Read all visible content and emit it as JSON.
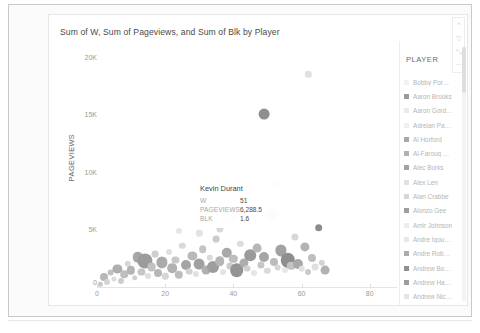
{
  "visual": {
    "title": "Sum of W, Sum of Pageviews, and Sum of Blk by Player"
  },
  "controls": {
    "expand_icon": "⌃",
    "filter_icon": "▽",
    "focus_icon": "⤡",
    "more_icon": "⋯"
  },
  "tooltip": {
    "title": "Kevin Durant",
    "rows": [
      {
        "key": "W",
        "value": "51"
      },
      {
        "key": "PAGEVIEWS",
        "value": "6,288.5"
      },
      {
        "key": "BLK",
        "value": "1.6"
      }
    ]
  },
  "legend": {
    "title": "PLAYER",
    "items": [
      {
        "label": "Bobby Por…",
        "color": "#f2f2f2"
      },
      {
        "label": "Aaron Brooks",
        "color": "#9a9a9a"
      },
      {
        "label": "Aaron Gord…",
        "color": "#eaeaea"
      },
      {
        "label": "Adreian Pa…",
        "color": "#f0f0f0"
      },
      {
        "label": "Al Horford",
        "color": "#a8a8a8"
      },
      {
        "label": "Al-Farouq …",
        "color": "#b0b0b0"
      },
      {
        "label": "Alec Burks",
        "color": "#a2a2a2"
      },
      {
        "label": "Alex Len",
        "color": "#e2e2e2"
      },
      {
        "label": "Alan Crabbe",
        "color": "#d6d6d6"
      },
      {
        "label": "Alonzo Gee",
        "color": "#9e9e9e"
      },
      {
        "label": "Amir Johnson",
        "color": "#ededed"
      },
      {
        "label": "Andre Igou…",
        "color": "#e8e8e8"
      },
      {
        "label": "Andre Rob…",
        "color": "#acacac"
      },
      {
        "label": "Andrew Bo…",
        "color": "#8f8f8f"
      },
      {
        "label": "Andrew Ha…",
        "color": "#9c9c9c"
      },
      {
        "label": "Andrew Nic…",
        "color": "#e4e4e4"
      },
      {
        "label": "Andrew Wi…",
        "color": "#dadada"
      },
      {
        "label": "Anthony Be…",
        "color": "#8a8a8a"
      }
    ]
  },
  "chart_data": {
    "type": "scatter",
    "title": "Sum of W, Sum of Pageviews, and Sum of Blk by Player",
    "xlabel": "W",
    "ylabel": "PAGEVIEWS",
    "size_field": "BLK",
    "legend_field": "PLAYER",
    "legend_position": "right",
    "grid": false,
    "xlim": [
      0,
      88
    ],
    "ylim": [
      0,
      21500
    ],
    "xticks": [
      0,
      20,
      40,
      60,
      80
    ],
    "xticklabels": [
      "0",
      "20",
      "40",
      "60",
      "80"
    ],
    "yticks": [
      0,
      5000,
      10000,
      15000,
      20000
    ],
    "yticklabels": [
      "0",
      "5K",
      "10K",
      "15K",
      "20K"
    ],
    "highlighted_point": {
      "label": "Kevin Durant",
      "x": 51,
      "y": 6288.5,
      "size": 1.6
    },
    "points": [
      {
        "x": 1,
        "y": 250,
        "r": 2.2,
        "c": "#c9c9c9"
      },
      {
        "x": 2,
        "y": 900,
        "r": 4.0,
        "c": "#b8b8b8"
      },
      {
        "x": 3,
        "y": 420,
        "r": 3.0,
        "c": "#d4d4d4"
      },
      {
        "x": 4,
        "y": 1250,
        "r": 3.4,
        "c": "#c0c0c0"
      },
      {
        "x": 5,
        "y": 700,
        "r": 2.6,
        "c": "#dcdcdc"
      },
      {
        "x": 6,
        "y": 1600,
        "r": 4.6,
        "c": "#aeaeae"
      },
      {
        "x": 7,
        "y": 500,
        "r": 3.0,
        "c": "#cdcdcd"
      },
      {
        "x": 8,
        "y": 1100,
        "r": 3.8,
        "c": "#bfbfbf"
      },
      {
        "x": 9,
        "y": 2050,
        "r": 3.2,
        "c": "#d8d8d8"
      },
      {
        "x": 10,
        "y": 1450,
        "r": 4.2,
        "c": "#b4b4b4"
      },
      {
        "x": 11,
        "y": 800,
        "r": 2.8,
        "c": "#d0d0d0"
      },
      {
        "x": 12,
        "y": 2600,
        "r": 5.2,
        "c": "#a6a6a6"
      },
      {
        "x": 13,
        "y": 1300,
        "r": 3.6,
        "c": "#c6c6c6"
      },
      {
        "x": 14,
        "y": 2300,
        "r": 7.6,
        "c": "#9c9c9c"
      },
      {
        "x": 15,
        "y": 1000,
        "r": 3.0,
        "c": "#dedede"
      },
      {
        "x": 16,
        "y": 1750,
        "r": 4.4,
        "c": "#c2c2c2"
      },
      {
        "x": 17,
        "y": 2900,
        "r": 3.4,
        "c": "#cfcfcf"
      },
      {
        "x": 18,
        "y": 1200,
        "r": 4.0,
        "c": "#b6b6b6"
      },
      {
        "x": 19,
        "y": 2150,
        "r": 5.6,
        "c": "#aaaaaa"
      },
      {
        "x": 20,
        "y": 950,
        "r": 3.2,
        "c": "#d6d6d6"
      },
      {
        "x": 21,
        "y": 3100,
        "r": 3.0,
        "c": "#e0e0e0"
      },
      {
        "x": 22,
        "y": 1650,
        "r": 4.8,
        "c": "#b2b2b2"
      },
      {
        "x": 23,
        "y": 2400,
        "r": 3.6,
        "c": "#c8c8c8"
      },
      {
        "x": 24,
        "y": 1050,
        "r": 4.2,
        "c": "#bcbcbc"
      },
      {
        "x": 25,
        "y": 3600,
        "r": 3.2,
        "c": "#dadada"
      },
      {
        "x": 26,
        "y": 1900,
        "r": 5.0,
        "c": "#a4a4a4"
      },
      {
        "x": 27,
        "y": 1350,
        "r": 3.4,
        "c": "#d2d2d2"
      },
      {
        "x": 28,
        "y": 2700,
        "r": 4.6,
        "c": "#b9b9b9"
      },
      {
        "x": 29,
        "y": 1150,
        "r": 3.0,
        "c": "#e2e2e2"
      },
      {
        "x": 30,
        "y": 2000,
        "r": 5.4,
        "c": "#a0a0a0"
      },
      {
        "x": 31,
        "y": 3300,
        "r": 3.8,
        "c": "#c4c4c4"
      },
      {
        "x": 32,
        "y": 1500,
        "r": 4.4,
        "c": "#b0b0b0"
      },
      {
        "x": 33,
        "y": 2550,
        "r": 3.2,
        "c": "#d9d9d9"
      },
      {
        "x": 34,
        "y": 1750,
        "r": 6.0,
        "c": "#9e9e9e"
      },
      {
        "x": 35,
        "y": 4200,
        "r": 3.4,
        "c": "#cbcbcb"
      },
      {
        "x": 36,
        "y": 2250,
        "r": 4.8,
        "c": "#b5b5b5"
      },
      {
        "x": 37,
        "y": 1300,
        "r": 3.0,
        "c": "#e4e4e4"
      },
      {
        "x": 38,
        "y": 3000,
        "r": 5.2,
        "c": "#a8a8a8"
      },
      {
        "x": 39,
        "y": 1850,
        "r": 3.6,
        "c": "#cccccc"
      },
      {
        "x": 40,
        "y": 2450,
        "r": 4.2,
        "c": "#bdbdbd"
      },
      {
        "x": 41,
        "y": 1450,
        "r": 6.8,
        "c": "#949494"
      },
      {
        "x": 42,
        "y": 3800,
        "r": 3.2,
        "c": "#dddddd"
      },
      {
        "x": 43,
        "y": 2100,
        "r": 4.6,
        "c": "#aeaeae"
      },
      {
        "x": 44,
        "y": 1600,
        "r": 3.4,
        "c": "#d1d1d1"
      },
      {
        "x": 45,
        "y": 2800,
        "r": 5.8,
        "c": "#9a9a9a"
      },
      {
        "x": 46,
        "y": 1250,
        "r": 3.0,
        "c": "#e6e6e6"
      },
      {
        "x": 47,
        "y": 3400,
        "r": 4.4,
        "c": "#b7b7b7"
      },
      {
        "x": 48,
        "y": 1950,
        "r": 3.6,
        "c": "#c7c7c7"
      },
      {
        "x": 49,
        "y": 2650,
        "r": 5.0,
        "c": "#a6a6a6"
      },
      {
        "x": 50,
        "y": 1400,
        "r": 3.2,
        "c": "#dbdbdb"
      },
      {
        "x": 51,
        "y": 6288,
        "r": 6.4,
        "c": "#cfcfcf"
      },
      {
        "x": 52,
        "y": 2200,
        "r": 4.0,
        "c": "#bbbbbb"
      },
      {
        "x": 53,
        "y": 1700,
        "r": 3.4,
        "c": "#d5d5d5"
      },
      {
        "x": 54,
        "y": 3200,
        "r": 5.6,
        "c": "#a2a2a2"
      },
      {
        "x": 55,
        "y": 1500,
        "r": 3.0,
        "c": "#e8e8e8"
      },
      {
        "x": 56,
        "y": 2350,
        "r": 7.2,
        "c": "#8e8e8e"
      },
      {
        "x": 57,
        "y": 1850,
        "r": 4.2,
        "c": "#c3c3c3"
      },
      {
        "x": 58,
        "y": 4400,
        "r": 3.6,
        "c": "#d7d7d7"
      },
      {
        "x": 59,
        "y": 2000,
        "r": 5.0,
        "c": "#a9a9a9"
      },
      {
        "x": 60,
        "y": 1600,
        "r": 3.2,
        "c": "#e1e1e1"
      },
      {
        "x": 61,
        "y": 3500,
        "r": 4.6,
        "c": "#b3b3b3"
      },
      {
        "x": 62,
        "y": 1350,
        "r": 3.0,
        "c": "#cacaca"
      },
      {
        "x": 63,
        "y": 2500,
        "r": 4.0,
        "c": "#bebebe"
      },
      {
        "x": 64,
        "y": 1750,
        "r": 3.4,
        "c": "#dfdfdf"
      },
      {
        "x": 65,
        "y": 5200,
        "r": 3.8,
        "c": "#8c8c8c"
      },
      {
        "x": 66,
        "y": 2100,
        "r": 3.2,
        "c": "#d3d3d3"
      },
      {
        "x": 67,
        "y": 1500,
        "r": 4.4,
        "c": "#b1b1b1"
      },
      {
        "x": 53,
        "y": 9000,
        "r": 3.0,
        "c": "#e0e0e0"
      },
      {
        "x": 49,
        "y": 15100,
        "r": 5.4,
        "c": "#8f8f8f"
      },
      {
        "x": 62,
        "y": 18600,
        "r": 3.2,
        "c": "#e0e0e0"
      },
      {
        "x": 44,
        "y": 5600,
        "r": 3.0,
        "c": "#dcdcdc"
      },
      {
        "x": 30,
        "y": 4700,
        "r": 3.2,
        "c": "#e3e3e3"
      },
      {
        "x": 36,
        "y": 5100,
        "r": 3.6,
        "c": "#d8d8d8"
      },
      {
        "x": 24,
        "y": 4900,
        "r": 3.0,
        "c": "#e6e6e6"
      },
      {
        "x": 40,
        "y": 6100,
        "r": 3.4,
        "c": "#dedede"
      }
    ]
  }
}
